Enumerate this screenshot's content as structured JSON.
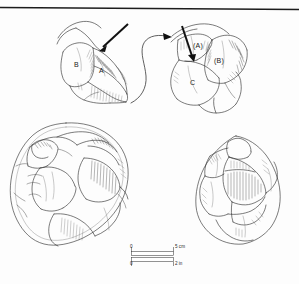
{
  "figure": {
    "kind": "lithic-core-reduction-illustration",
    "background_color": "#fdfdfd",
    "ink_color": "#2b2b2b",
    "top_rule_color": "#1c1c1c"
  },
  "diagrams": {
    "left": {
      "name": "core-platform-before",
      "labels": [
        {
          "id": "label-b-left",
          "text": "B",
          "x": 76,
          "y": 65
        },
        {
          "id": "label-a-left",
          "text": "A",
          "x": 100,
          "y": 70
        }
      ],
      "arrow": {
        "name": "blow-direction-arrow-left",
        "description": "thick straight arrow striking platform"
      }
    },
    "right": {
      "name": "core-platform-after",
      "labels": [
        {
          "id": "label-a-right",
          "text": "(A)",
          "x": 196,
          "y": 47
        },
        {
          "id": "label-b-right",
          "text": "(B)",
          "x": 216,
          "y": 62
        },
        {
          "id": "label-c-right",
          "text": "C",
          "x": 192,
          "y": 82
        }
      ],
      "arrow": {
        "name": "blow-direction-arrow-right",
        "description": "thick straight arrow striking platform"
      }
    },
    "transition_arrow": {
      "name": "transition-arrow",
      "description": "long S-curved arrow linking left diagram to right diagram"
    }
  },
  "artifacts": [
    {
      "id": "artifact-left",
      "name": "discoidal-core-drawing",
      "description": "circular discoidal flaked stone core, plan view with flake scars and hatching",
      "bounds": {
        "x": 8,
        "y": 122,
        "width": 120,
        "height": 130
      }
    },
    {
      "id": "artifact-right",
      "name": "ovoid-core-drawing",
      "description": "ovoid flaked stone core, profile view with flake scars and hatching",
      "bounds": {
        "x": 196,
        "y": 136,
        "width": 84,
        "height": 109
      }
    }
  ],
  "scale_bar": {
    "name": "scale-bar",
    "metric": {
      "start_label": "0",
      "end_label": "5 cm",
      "unit": "cm",
      "length": 5
    },
    "imperial": {
      "start_label": "0",
      "end_label": "2 in",
      "unit": "in",
      "length": 2
    }
  }
}
